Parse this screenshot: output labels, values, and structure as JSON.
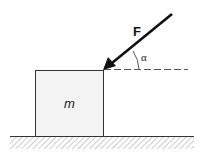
{
  "diagram": {
    "labels": {
      "force": "F",
      "angle": "α",
      "mass": "m"
    },
    "colors": {
      "line": "#222222",
      "block_fill": "#f3f3f3",
      "hatch": "#999999"
    }
  }
}
